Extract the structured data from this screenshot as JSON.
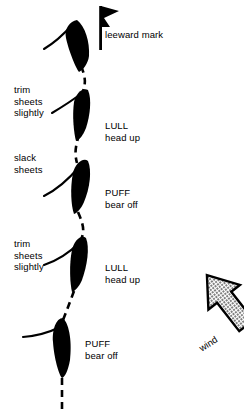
{
  "diagram": {
    "colors": {
      "ink": "#000000",
      "background": "#ffffff",
      "arrow_fill": "#9a9a9a",
      "arrow_stroke": "#000000"
    },
    "mark": {
      "label": "leeward mark",
      "icon": "flag-icon"
    },
    "wind": {
      "label": "wind",
      "icon": "wind-arrow-icon",
      "direction": "up-left"
    },
    "left_labels": [
      {
        "name": "trim-sheets-slightly-upper",
        "lines": [
          "trim",
          "sheets",
          "slightly"
        ],
        "x": 14,
        "y": 84
      },
      {
        "name": "slack-sheets",
        "lines": [
          "slack",
          "sheets"
        ],
        "x": 14,
        "y": 152
      },
      {
        "name": "trim-sheets-slightly-lower",
        "lines": [
          "trim",
          "sheets",
          "slightly"
        ],
        "x": 14,
        "y": 238
      }
    ],
    "right_labels": [
      {
        "name": "lull-head-up-upper",
        "lines": [
          "LULL",
          "head up"
        ],
        "x": 105,
        "y": 120
      },
      {
        "name": "puff-bear-off-upper",
        "lines": [
          "PUFF",
          "bear off"
        ],
        "x": 105,
        "y": 187
      },
      {
        "name": "lull-head-up-lower",
        "lines": [
          "LULL",
          "head up"
        ],
        "x": 105,
        "y": 262
      },
      {
        "name": "puff-bear-off-lower",
        "lines": [
          "PUFF",
          "bear off"
        ],
        "x": 85,
        "y": 338
      }
    ],
    "boats": [
      {
        "name": "boat-1",
        "state": "at-leeward-mark"
      },
      {
        "name": "boat-2",
        "state": "lull-head-up"
      },
      {
        "name": "boat-3",
        "state": "puff-bear-off"
      },
      {
        "name": "boat-4",
        "state": "lull-head-up"
      },
      {
        "name": "boat-5",
        "state": "puff-bear-off"
      }
    ],
    "track": {
      "name": "dashed-course-track",
      "style": "dashed"
    }
  }
}
